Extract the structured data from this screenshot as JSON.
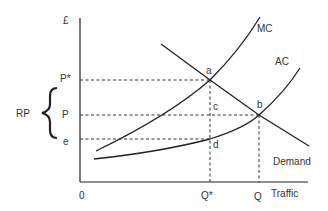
{
  "diagram": {
    "axes": {
      "y_label": "£",
      "x_label": "Traffic",
      "origin": "0"
    },
    "price_labels": {
      "p_star": "P*",
      "p": "P",
      "e": "e"
    },
    "quantity_labels": {
      "q_star": "Q*",
      "q": "Q"
    },
    "brace_label": "RP",
    "curves": {
      "mc": "MC",
      "ac": "AC",
      "demand": "Demand"
    },
    "points": {
      "a": "a",
      "b": "b",
      "c": "c",
      "d": "d"
    },
    "colors": {
      "line": "#222222",
      "text": "#333333"
    }
  }
}
